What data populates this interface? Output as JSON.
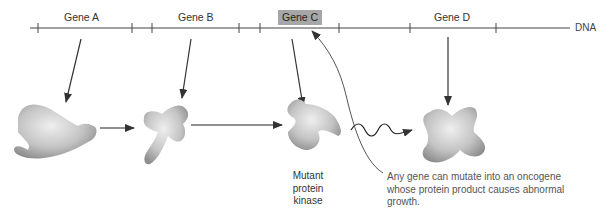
{
  "genes": [
    {
      "label": "Gene A"
    },
    {
      "label": "Gene B"
    },
    {
      "label": "Gene C",
      "highlighted": true
    },
    {
      "label": "Gene D"
    }
  ],
  "dna_label": "DNA",
  "mutant_caption": [
    "Mutant",
    "protein",
    "kinase"
  ],
  "note": [
    "Any gene can mutate into an oncogene",
    "whose protein product causes abnormal",
    "growth."
  ],
  "colors": {
    "line": "#444444",
    "highlight": "#a6a6a6",
    "protein_light": "#e6e6e6",
    "protein_dark": "#9a9a9a"
  }
}
